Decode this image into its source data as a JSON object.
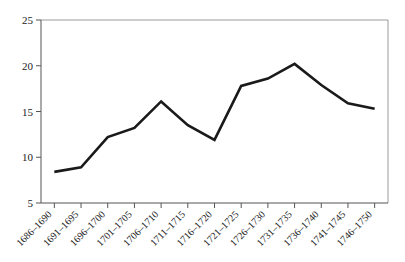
{
  "chart_data": {
    "type": "line",
    "title": "",
    "subtitle": "",
    "xlabel": "",
    "ylabel": "",
    "categories": [
      "1686–1690",
      "1691–1695",
      "1696–1700",
      "1701–1705",
      "1706–1710",
      "1711–1715",
      "1716–1720",
      "1721–1725",
      "1726–1730",
      "1731–1735",
      "1736–1740",
      "1741–1745",
      "1746–1750"
    ],
    "values": [
      8.4,
      8.9,
      12.2,
      13.2,
      16.1,
      13.5,
      11.9,
      17.8,
      18.6,
      20.2,
      17.9,
      15.9,
      15.3
    ],
    "series": [
      {
        "name": "series-1",
        "values": [
          8.4,
          8.9,
          12.2,
          13.2,
          16.1,
          13.5,
          11.9,
          17.8,
          18.6,
          20.2,
          17.9,
          15.9,
          15.3
        ],
        "color": "#1a1a1a"
      }
    ],
    "ylim": [
      5,
      25
    ],
    "yticks": [
      5,
      10,
      15,
      20,
      25
    ],
    "ytick_labels": [
      "5",
      "10",
      "15",
      "20",
      "25"
    ],
    "grid": false,
    "legend": false,
    "legend_position": "none",
    "xtick_rotation": -45,
    "colors": {
      "line": "#1a1a1a",
      "axis": "#555555",
      "plot_border": "#9a9a9a",
      "background": "#ffffff",
      "text": "#222222"
    }
  }
}
